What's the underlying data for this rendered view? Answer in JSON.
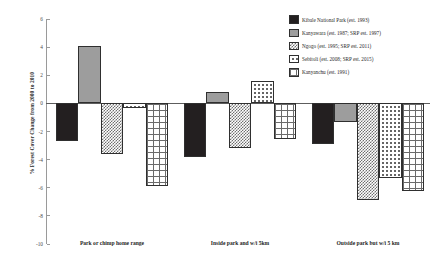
{
  "chart_data": {
    "type": "bar",
    "title": "",
    "xlabel": "",
    "ylabel": "% Forest Cover Change from 2000 to 2010",
    "ylim": [
      -10,
      6
    ],
    "yticks": [
      6,
      4,
      2,
      0,
      -2,
      -4,
      -6,
      -8,
      -10
    ],
    "ytick_labels": [
      "6",
      "4",
      "2",
      "0",
      "-2",
      "-4",
      "-6",
      "-8",
      "-10"
    ],
    "grid": false,
    "legend_position": "top-right",
    "categories": [
      "Park or chimp home range",
      "Inside park and w/i 5km",
      "Outside park but w/i 5 km"
    ],
    "series": [
      {
        "name": "Kibale National Park (est. 1993)",
        "pattern": "solid-black",
        "color": "#231f20",
        "values": [
          -2.7,
          -3.8,
          -2.9
        ]
      },
      {
        "name": "Kanyawara (est. 1987; SRP est. 1997)",
        "pattern": "gray",
        "color": "#9d9d9d",
        "values": [
          4.1,
          0.8,
          -1.3
        ]
      },
      {
        "name": "Ngogo (est. 1995; SRP est. 2011)",
        "pattern": "checker",
        "color": "#6f6f6f",
        "values": [
          -3.6,
          -3.2,
          -6.9
        ]
      },
      {
        "name": "Sebitoli (est. 2008; SRP est. 2015)",
        "pattern": "dots",
        "color": "#5a5a5a",
        "values": [
          -0.3,
          1.6,
          -5.3
        ]
      },
      {
        "name": "Kanyanchu (est. 1991)",
        "pattern": "grid",
        "color": "#6b6b6b",
        "values": [
          -5.9,
          -2.5,
          -6.2
        ]
      }
    ]
  }
}
